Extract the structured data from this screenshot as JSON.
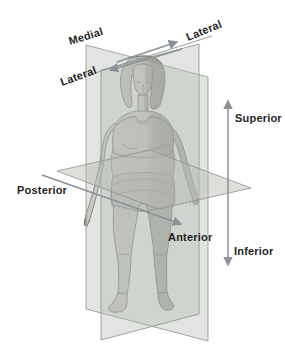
{
  "labels": {
    "medial": "Medial",
    "lateral_top_right": "Lateral",
    "lateral_left": "Lateral",
    "superior": "Superior",
    "inferior": "Inferior",
    "posterior": "Posterior",
    "anterior": "Anterior"
  },
  "colors": {
    "background": "#ffffff",
    "plane_fill": "#c5c9c2",
    "plane_edge": "#8d938c",
    "arrow": "#8b9196",
    "label_text": "#1f1f1f",
    "figure_outline": "#4c4a48",
    "skin_light": "#d7d5d0",
    "skin_shaded": "#9a9893",
    "garment_light": "#c9c8c4",
    "garment_shaded": "#8f8e8b"
  }
}
